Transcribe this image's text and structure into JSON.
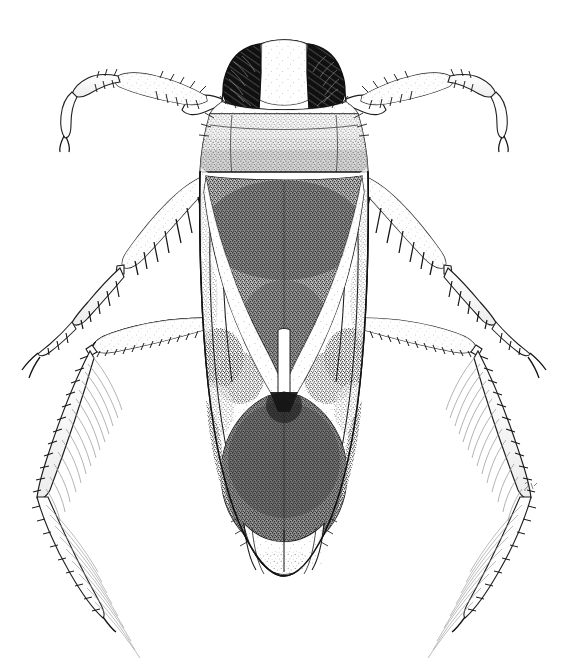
{
  "figure": {
    "type": "scientific-illustration",
    "medium": "pen-and-ink stipple line drawing",
    "view": "dorsal",
    "background_color": "#ffffff",
    "ink_color": "#1a1a1a",
    "caption": "",
    "artist_initials": "",
    "scale_bar": ""
  },
  "canvas": {
    "width": 563,
    "height": 658
  },
  "palette": {
    "paper": "#ffffff",
    "ink": "#1a1a1a",
    "eye_dark": "#141414",
    "pronotum_gray": "#b9b9b9",
    "scutellum_dark": "#4a4a4a",
    "corium_pale": "#f2f2f2",
    "corium_mottle": "#8a8a8a",
    "membrane_dark": "#545454",
    "leg_pale": "#fbfbfb",
    "hair_gray": "#9a9a9a"
  },
  "anatomy": {
    "parts": [
      {
        "id": "head",
        "label": "Head (vertex)",
        "shade": "pale",
        "interactable": false
      },
      {
        "id": "eye-left",
        "label": "Left compound eye",
        "shade": "black",
        "interactable": false
      },
      {
        "id": "eye-right",
        "label": "Right compound eye",
        "shade": "black",
        "interactable": false
      },
      {
        "id": "pronotum",
        "label": "Pronotum",
        "shade": "light-gray-stipple",
        "interactable": false
      },
      {
        "id": "scutellum",
        "label": "Scutellum",
        "shade": "dark-stipple",
        "interactable": false
      },
      {
        "id": "clavus-left",
        "label": "Left clavus",
        "shade": "pale",
        "interactable": false
      },
      {
        "id": "clavus-right",
        "label": "Right clavus",
        "shade": "pale",
        "interactable": false
      },
      {
        "id": "corium-left",
        "label": "Left corium (hemelytron)",
        "shade": "mottled",
        "interactable": false
      },
      {
        "id": "corium-right",
        "label": "Right corium (hemelytron)",
        "shade": "mottled",
        "interactable": false
      },
      {
        "id": "membrane",
        "label": "Membrane of hemelytra",
        "shade": "dark-stipple",
        "interactable": false
      },
      {
        "id": "abdomen-tip",
        "label": "Abdominal apex",
        "shade": "pale",
        "interactable": false
      },
      {
        "id": "foreleg-left",
        "label": "Left foreleg",
        "shade": "pale",
        "interactable": false
      },
      {
        "id": "foreleg-right",
        "label": "Right foreleg",
        "shade": "pale",
        "interactable": false
      },
      {
        "id": "midleg-left",
        "label": "Left middle leg",
        "shade": "pale",
        "interactable": false
      },
      {
        "id": "midleg-right",
        "label": "Right middle leg",
        "shade": "pale",
        "interactable": false
      },
      {
        "id": "hindleg-left",
        "label": "Left hind (swimming) leg",
        "shade": "pale-hairy",
        "interactable": false
      },
      {
        "id": "hindleg-right",
        "label": "Right hind (swimming) leg",
        "shade": "pale-hairy",
        "interactable": false
      }
    ]
  }
}
